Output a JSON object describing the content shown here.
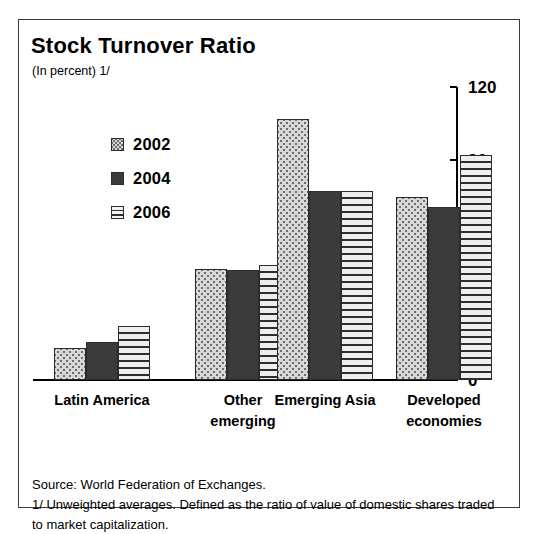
{
  "title": "Stock Turnover Ratio",
  "subtitle": "(In percent) 1/",
  "legend": {
    "items": [
      {
        "label": "2002",
        "swatch": "dotted-swatch-icon"
      },
      {
        "label": "2004",
        "swatch": "solid-swatch-icon"
      },
      {
        "label": "2006",
        "swatch": "hatched-swatch-icon"
      }
    ]
  },
  "axis": {
    "ticks": [
      "0",
      "30",
      "60",
      "90",
      "120"
    ]
  },
  "categories": [
    {
      "line1": "Latin America",
      "line2": ""
    },
    {
      "line1": "Other",
      "line2": "emerging"
    },
    {
      "line1": "Emerging Asia",
      "line2": ""
    },
    {
      "line1": "Developed",
      "line2": "economies"
    }
  ],
  "footer": {
    "source": "Source: World Federation of Exchanges.",
    "footnote": "1/ Unweighted averages. Defined as the ratio of value of domestic shares traded to market capitalization."
  },
  "colors": {
    "series_2002": "#d8d8d8",
    "series_2004": "#3b3b3b",
    "series_2006": "#f0f0f0",
    "axis": "#000000",
    "border": "#3a3a3a"
  },
  "chart_data": {
    "type": "bar",
    "title": "Stock Turnover Ratio",
    "subtitle": "(In percent) 1/",
    "xlabel": "",
    "ylabel": "",
    "ylim": [
      0,
      120
    ],
    "yticks": [
      0,
      30,
      60,
      90,
      120
    ],
    "grid": false,
    "legend_position": "upper-left-inside",
    "categories": [
      "Latin America",
      "Other emerging",
      "Emerging Asia",
      "Developed economies"
    ],
    "series": [
      {
        "name": "2002",
        "values": [
          13,
          45.5,
          107,
          75
        ]
      },
      {
        "name": "2004",
        "values": [
          15.5,
          45,
          77.5,
          71
        ]
      },
      {
        "name": "2006",
        "values": [
          22,
          47,
          77.5,
          92
        ]
      }
    ],
    "annotations": [
      "Source: World Federation of Exchanges.",
      "1/ Unweighted averages. Defined as the ratio of value of domestic shares traded to market capitalization."
    ]
  }
}
